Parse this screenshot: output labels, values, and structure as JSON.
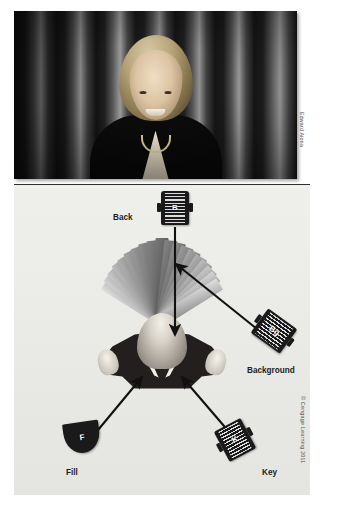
{
  "photo": {
    "alt_description": "Studio portrait of a smiling woman in a dark jacket in front of a pleated curtain backdrop",
    "credit": "Edward Aiona"
  },
  "diagram": {
    "copyright": "© Cengage Learning 2011",
    "subject_name": "subject-head-top-view",
    "backdrop_name": "pleated-curtain-fan",
    "lights": [
      {
        "id": "back",
        "abbr": "B",
        "caption": "Back",
        "shape": "fresnel-barrel"
      },
      {
        "id": "background",
        "abbr": "Bg",
        "caption": "Background",
        "shape": "fresnel-barrel"
      },
      {
        "id": "fill",
        "abbr": "F",
        "caption": "Fill",
        "shape": "softlight-scoop"
      },
      {
        "id": "key",
        "abbr": "K",
        "caption": "Key",
        "shape": "fresnel-barrel"
      }
    ],
    "arrows": [
      {
        "from": "back",
        "to": "subject"
      },
      {
        "from": "background",
        "to": "backdrop"
      },
      {
        "from": "fill",
        "to": "subject"
      },
      {
        "from": "key",
        "to": "subject"
      }
    ],
    "colors": {
      "panel_background": "#ececeA",
      "fixture_body": "#1a1a1a",
      "arrow": "#111111",
      "label_text": "#1c1c1c"
    }
  }
}
